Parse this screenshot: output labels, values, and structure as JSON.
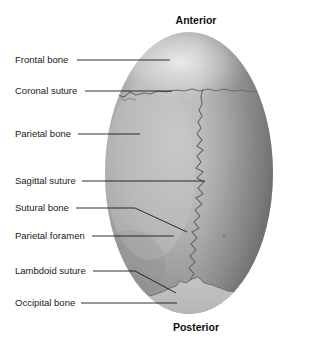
{
  "headings": {
    "top": "Anterior",
    "bottom": "Posterior"
  },
  "labels": [
    {
      "id": "frontal-bone",
      "text": "Frontal bone",
      "y": 60
    },
    {
      "id": "coronal-suture",
      "text": "Coronal suture",
      "y": 91
    },
    {
      "id": "parietal-bone",
      "text": "Parietal bone",
      "y": 134
    },
    {
      "id": "sagittal-suture",
      "text": "Sagittal suture",
      "y": 181
    },
    {
      "id": "sutural-bone",
      "text": "Sutural bone",
      "y": 208
    },
    {
      "id": "parietal-foramen",
      "text": "Parietal foramen",
      "y": 236
    },
    {
      "id": "lambdoid-suture",
      "text": "Lambdoid suture",
      "y": 271
    },
    {
      "id": "occipital-bone",
      "text": "Occipital bone",
      "y": 303
    }
  ],
  "colors": {
    "skull_dark": "#7a7a7a",
    "skull_mid": "#a6a6a6",
    "skull_light": "#dcdcdc",
    "suture": "#6b6b6b",
    "leader_line": "#1a1a1a",
    "text": "#1a1a1a"
  }
}
